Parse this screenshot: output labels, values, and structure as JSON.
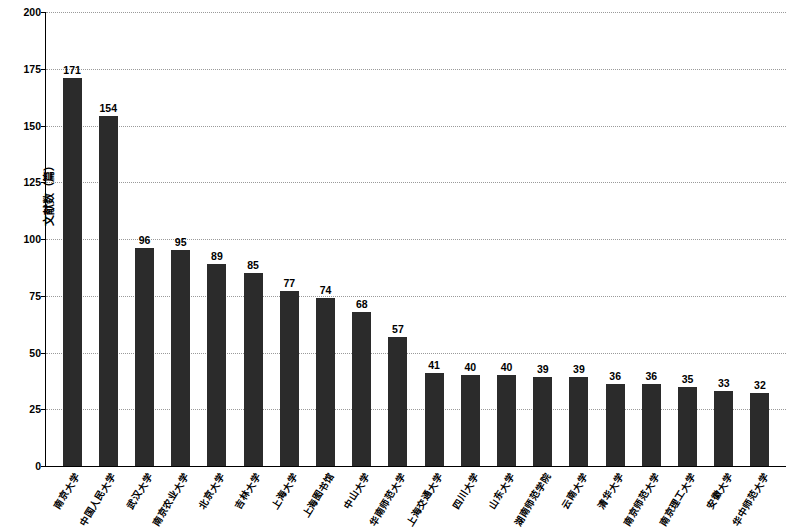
{
  "chart_data": {
    "type": "bar",
    "title": "",
    "xlabel": "",
    "ylabel": "文献数（篇）",
    "ylim": [
      0,
      200
    ],
    "yticks": [
      0,
      25,
      50,
      75,
      100,
      125,
      150,
      175,
      200
    ],
    "grid": true,
    "legend": null,
    "bar_color": "#2b2b2b",
    "categories": [
      "南京大学",
      "中国人民大学",
      "武汉大学",
      "南京农业大学",
      "北京大学",
      "吉林大学",
      "上海大学",
      "上海图书馆",
      "中山大学",
      "华南师范大学",
      "上海交通大学",
      "四川大学",
      "山东大学",
      "湖南师范学院",
      "云南大学",
      "清华大学",
      "南京师范大学",
      "南京理工大学",
      "安徽大学",
      "华中师范大学"
    ],
    "values": [
      171,
      154,
      96,
      95,
      89,
      85,
      77,
      74,
      68,
      57,
      41,
      40,
      40,
      39,
      39,
      36,
      36,
      35,
      33,
      32
    ]
  }
}
